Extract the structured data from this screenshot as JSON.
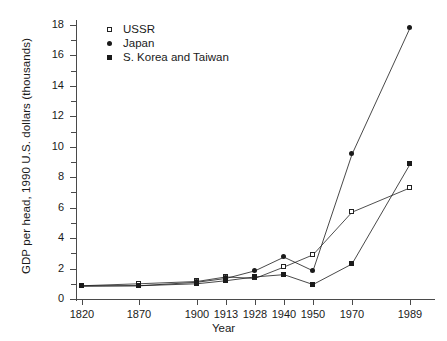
{
  "chart_data": {
    "type": "line",
    "title": "",
    "xlabel": "Year",
    "ylabel": "GDP per head, 1990 U.S. dollars (thousands)",
    "categories": [
      "1820",
      "1870",
      "1900",
      "1913",
      "1928",
      "1940",
      "1950",
      "1970",
      "1989"
    ],
    "ylim": [
      0,
      18
    ],
    "ytick_labels": [
      "0",
      "2",
      "4",
      "6",
      "8",
      "10",
      "12",
      "14",
      "16",
      "18"
    ],
    "ytick_values": [
      0,
      2,
      4,
      6,
      8,
      10,
      12,
      14,
      16,
      18
    ],
    "yminor_values": [
      1,
      3,
      5,
      7,
      9,
      11,
      13,
      15,
      17
    ],
    "grid": false,
    "legend_position": "top-left",
    "series": [
      {
        "name": "USSR",
        "marker": "open-square",
        "color": "#222222",
        "values": [
          0.87,
          1.0,
          1.15,
          1.45,
          1.35,
          2.1,
          2.9,
          5.7,
          7.3
        ]
      },
      {
        "name": "Japan",
        "marker": "filled-circle",
        "color": "#1a1a1a",
        "values": [
          0.85,
          0.87,
          1.1,
          1.35,
          1.85,
          2.75,
          1.85,
          9.5,
          17.8
        ]
      },
      {
        "name": "S. Korea and Taiwan",
        "marker": "filled-square",
        "color": "#1a1a1a",
        "values": [
          0.85,
          0.87,
          1.0,
          1.2,
          1.45,
          1.6,
          0.95,
          2.3,
          8.85
        ]
      }
    ]
  },
  "legend": {
    "items": [
      {
        "label": "USSR",
        "marker": "open-square"
      },
      {
        "label": "Japan",
        "marker": "filled-circle"
      },
      {
        "label": "S. Korea and Taiwan",
        "marker": "filled-square"
      }
    ]
  },
  "axes": {
    "x_title": "Year",
    "y_title": "GDP per head, 1990 U.S. dollars (thousands)"
  }
}
